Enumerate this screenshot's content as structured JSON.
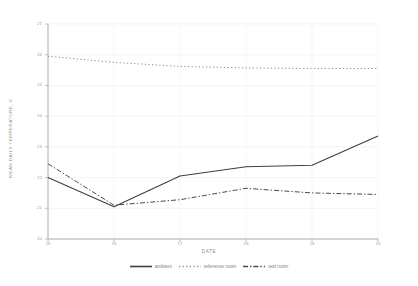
{
  "chart_data": {
    "type": "line",
    "title": "",
    "xlabel": "DATE",
    "ylabel": "MEAN DAILY TEMPERATURE, C",
    "x": [
      15,
      16,
      17,
      18,
      19,
      20
    ],
    "xlim": [
      15,
      20
    ],
    "ylim": [
      20,
      27
    ],
    "yticks": [
      20,
      21,
      22,
      23,
      24,
      25,
      26,
      27
    ],
    "xticks": [
      15,
      16,
      17,
      18,
      19,
      20
    ],
    "grid": true,
    "legend_position": "bottom",
    "series": [
      {
        "name": "ambient",
        "style": "solid",
        "color": "#3f3f3f",
        "values": [
          22.0,
          21.05,
          22.05,
          22.35,
          22.4,
          23.35
        ]
      },
      {
        "name": "reference room",
        "style": "dotted",
        "color": "#8a8a8a",
        "values": [
          25.95,
          25.75,
          25.62,
          25.57,
          25.55,
          25.55
        ]
      },
      {
        "name": "test room",
        "style": "dash-dot",
        "color": "#4a4a4a",
        "values": [
          22.45,
          21.1,
          21.28,
          21.65,
          21.5,
          21.45
        ]
      }
    ]
  },
  "axis": {
    "ytick_labels": [
      "20",
      "21",
      "22",
      "23",
      "24",
      "25",
      "26",
      "27"
    ],
    "xtick_labels": [
      "15",
      "16",
      "17",
      "18",
      "19",
      "20"
    ]
  },
  "legend": {
    "items": [
      {
        "label": "ambient"
      },
      {
        "label": "reference room"
      },
      {
        "label": "test room"
      }
    ]
  }
}
